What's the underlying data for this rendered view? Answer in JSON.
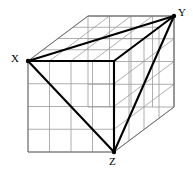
{
  "figure": {
    "type": "geometry-diagram",
    "canvas": {
      "width": 193,
      "height": 176,
      "background": "#ffffff"
    },
    "projection": {
      "front_top_left": [
        28,
        61
      ],
      "front_bottom_right": [
        114,
        152
      ],
      "front_width": 86,
      "front_height": 91,
      "depth_vector": [
        60,
        -45
      ],
      "divisions": 4
    },
    "colors": {
      "grid": "#9a9a9a",
      "outline": "#6e6e6e",
      "highlight": "#000000",
      "label": "#000000",
      "vertex_dot": "#000000"
    },
    "stroke_widths": {
      "grid": 0.8,
      "outline": 1.0,
      "highlight": 2.1
    },
    "labels": [
      {
        "id": "X",
        "text": "X",
        "x": 11,
        "y": 53,
        "vertex": [
          28,
          61
        ],
        "corner": "front-top-left"
      },
      {
        "id": "Y",
        "text": "Y",
        "x": 178,
        "y": 7,
        "vertex": [
          174,
          16
        ],
        "corner": "back-top-right"
      },
      {
        "id": "Z",
        "text": "Z",
        "x": 109,
        "y": 156,
        "vertex": [
          114,
          152
        ],
        "corner": "front-bottom-right"
      }
    ],
    "highlighted_edges": [
      {
        "name": "X-to-Y",
        "from": "X",
        "to": "Y",
        "points": [
          [
            28,
            61
          ],
          [
            174,
            16
          ]
        ]
      },
      {
        "name": "X-to-front-top-right",
        "from": "X",
        "to": "front-top-right",
        "points": [
          [
            28,
            61
          ],
          [
            114,
            61
          ]
        ]
      },
      {
        "name": "front-top-right-to-Y",
        "from": "front-top-right",
        "to": "Y",
        "points": [
          [
            114,
            61
          ],
          [
            174,
            16
          ]
        ]
      },
      {
        "name": "X-to-Z",
        "from": "X",
        "to": "Z",
        "points": [
          [
            28,
            61
          ],
          [
            114,
            152
          ]
        ]
      },
      {
        "name": "Z-to-Y",
        "from": "Z",
        "to": "Y",
        "points": [
          [
            114,
            152
          ],
          [
            174,
            16
          ]
        ]
      },
      {
        "name": "Z-to-front-top-right",
        "from": "Z",
        "to": "front-top-right",
        "points": [
          [
            114,
            152
          ],
          [
            114,
            61
          ]
        ]
      }
    ]
  }
}
